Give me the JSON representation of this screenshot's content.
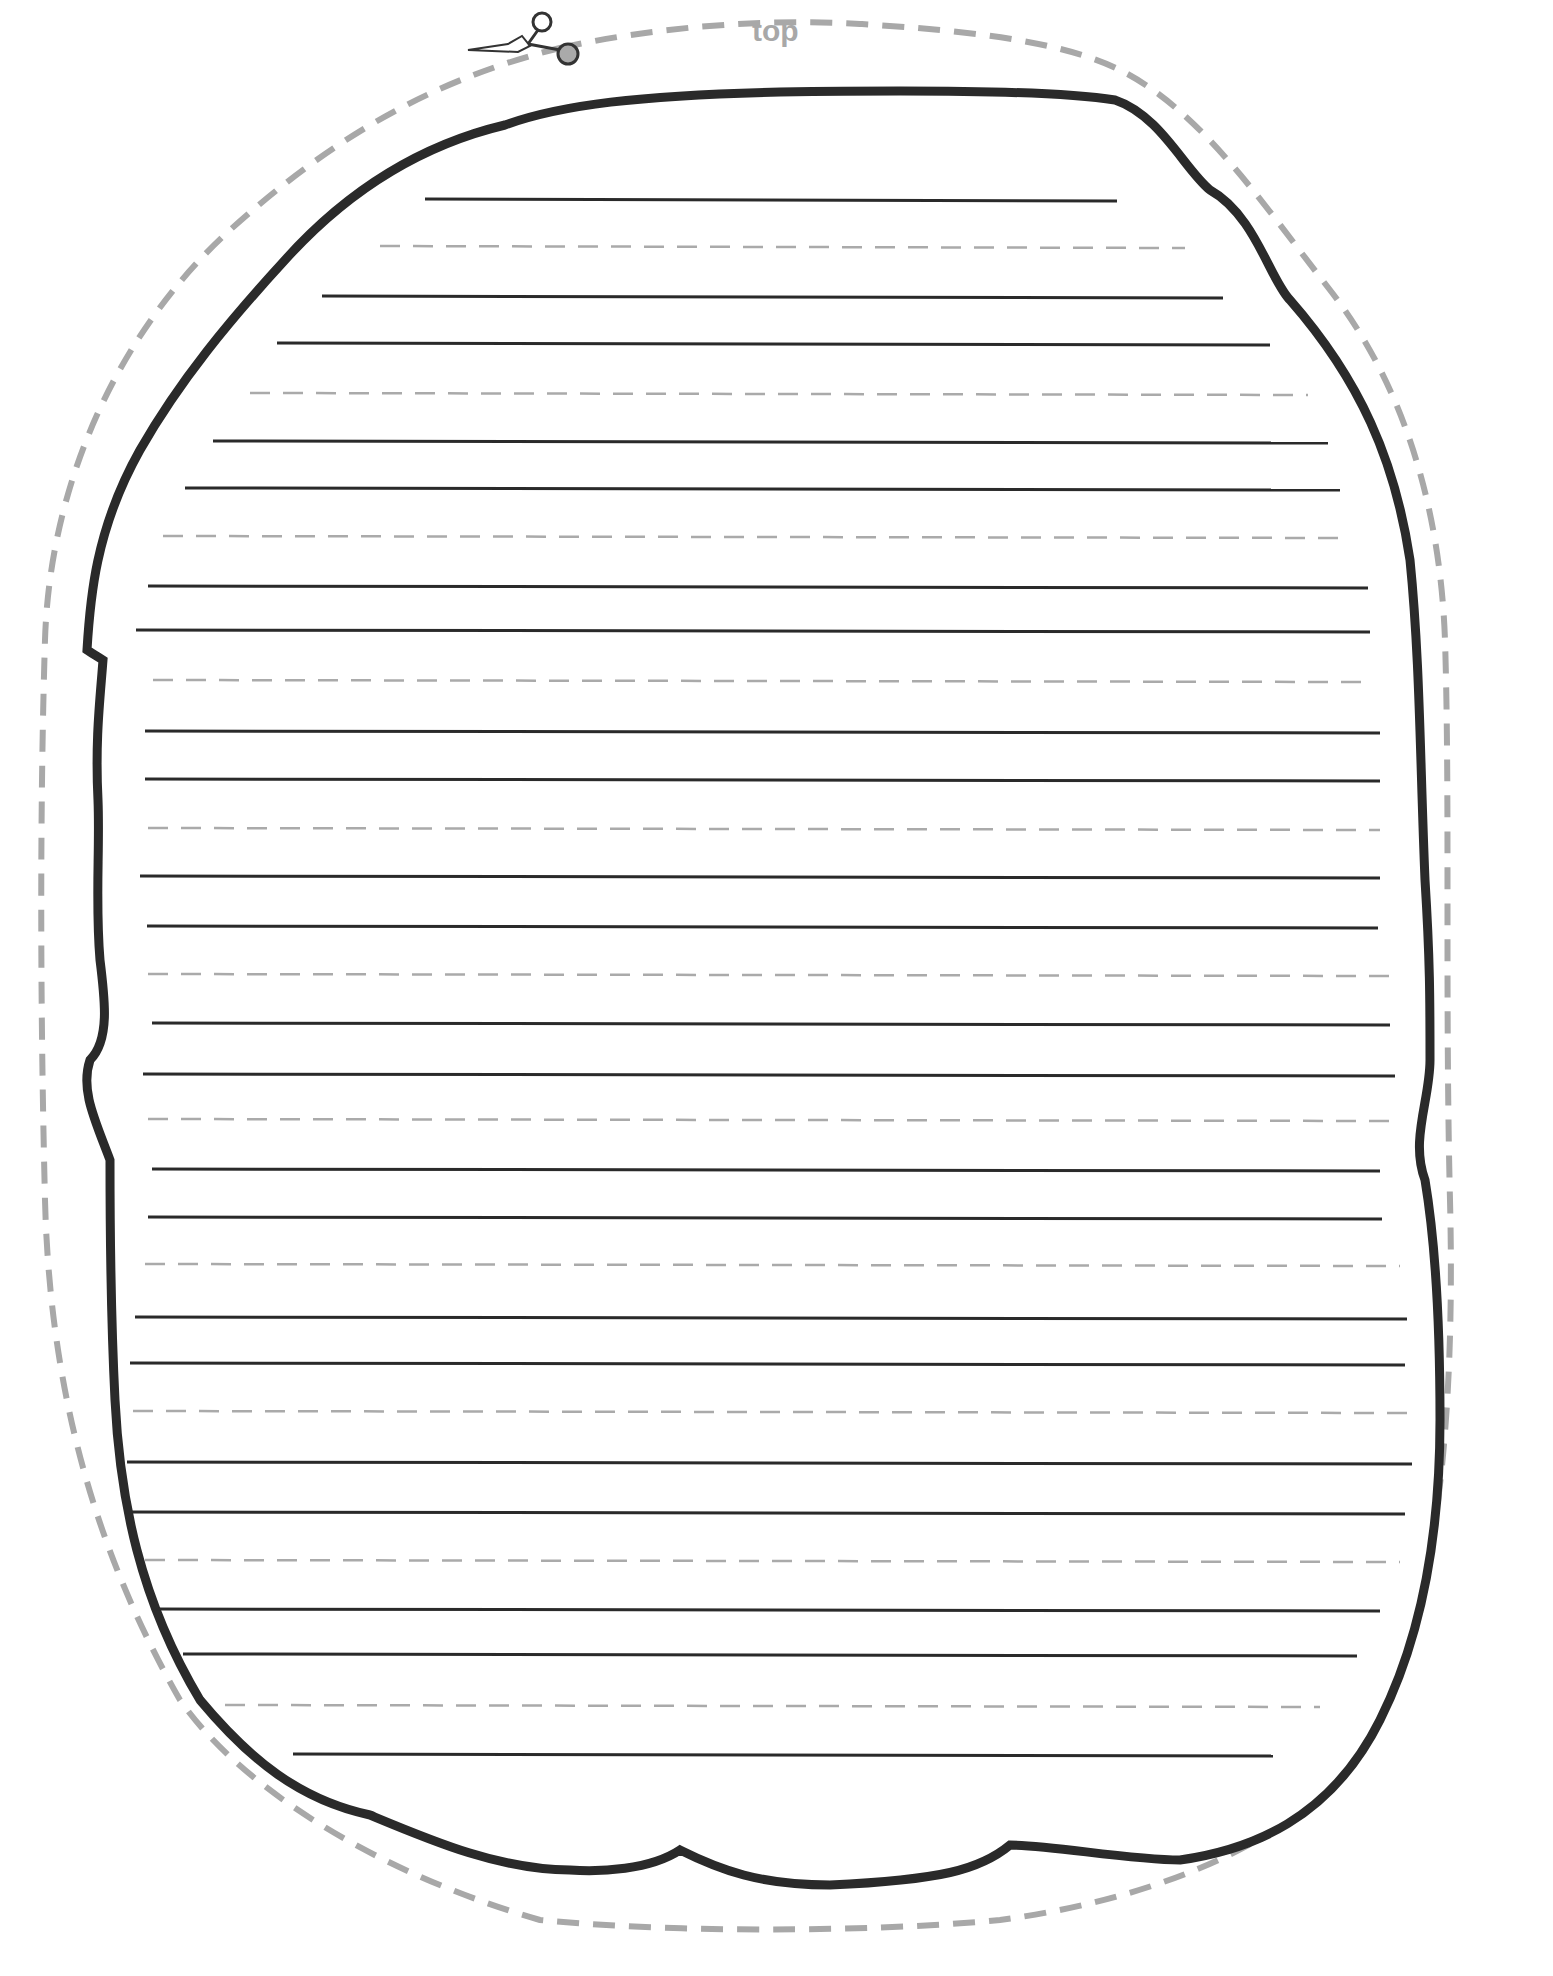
{
  "worksheet": {
    "top_label": "top",
    "cut_icon": "scissors-icon",
    "colors": {
      "outline": "#2a2a2a",
      "cut_line": "#a8a8a8",
      "guide_dash": "#aaaaaa",
      "writing_line": "#2a2a2a"
    },
    "solid_lines": [
      {
        "y": 199,
        "x1": 425,
        "x2": 1117
      },
      {
        "y": 296,
        "x1": 322,
        "x2": 1223
      },
      {
        "y": 343,
        "x1": 277,
        "x2": 1270
      },
      {
        "y": 441,
        "x1": 213,
        "x2": 1328
      },
      {
        "y": 488,
        "x1": 185,
        "x2": 1340
      },
      {
        "y": 586,
        "x1": 148,
        "x2": 1368
      },
      {
        "y": 630,
        "x1": 136,
        "x2": 1370
      },
      {
        "y": 731,
        "x1": 145,
        "x2": 1380
      },
      {
        "y": 779,
        "x1": 145,
        "x2": 1380
      },
      {
        "y": 876,
        "x1": 140,
        "x2": 1380
      },
      {
        "y": 926,
        "x1": 147,
        "x2": 1378
      },
      {
        "y": 1023,
        "x1": 152,
        "x2": 1390
      },
      {
        "y": 1074,
        "x1": 143,
        "x2": 1395
      },
      {
        "y": 1169,
        "x1": 152,
        "x2": 1380
      },
      {
        "y": 1217,
        "x1": 148,
        "x2": 1382
      },
      {
        "y": 1317,
        "x1": 135,
        "x2": 1407
      },
      {
        "y": 1363,
        "x1": 130,
        "x2": 1405
      },
      {
        "y": 1462,
        "x1": 127,
        "x2": 1412
      },
      {
        "y": 1512,
        "x1": 130,
        "x2": 1405
      },
      {
        "y": 1609,
        "x1": 155,
        "x2": 1380
      },
      {
        "y": 1654,
        "x1": 183,
        "x2": 1357
      },
      {
        "y": 1754,
        "x1": 293,
        "x2": 1273
      }
    ],
    "dashed_lines": [
      {
        "y": 246,
        "x1": 380,
        "x2": 1185
      },
      {
        "y": 393,
        "x1": 250,
        "x2": 1308
      },
      {
        "y": 536,
        "x1": 163,
        "x2": 1350
      },
      {
        "y": 680,
        "x1": 153,
        "x2": 1370
      },
      {
        "y": 828,
        "x1": 148,
        "x2": 1380
      },
      {
        "y": 974,
        "x1": 148,
        "x2": 1390
      },
      {
        "y": 1119,
        "x1": 148,
        "x2": 1395
      },
      {
        "y": 1264,
        "x1": 145,
        "x2": 1400
      },
      {
        "y": 1411,
        "x1": 133,
        "x2": 1407
      },
      {
        "y": 1560,
        "x1": 145,
        "x2": 1400
      },
      {
        "y": 1705,
        "x1": 225,
        "x2": 1320
      }
    ]
  }
}
